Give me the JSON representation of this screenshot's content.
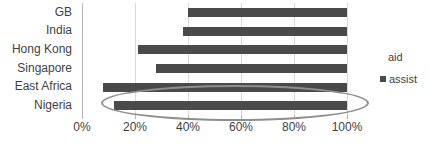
{
  "chart_data": {
    "type": "bar",
    "orientation": "horizontal",
    "title": "",
    "xlabel": "",
    "ylabel": "",
    "categories": [
      "GB",
      "India",
      "Hong Kong",
      "Singapore",
      "East Africa",
      "Nigeria"
    ],
    "series": [
      {
        "name": "assist",
        "starts": [
          40,
          38,
          21,
          28,
          8,
          12
        ],
        "ends": [
          100,
          100,
          100,
          100,
          100,
          100
        ],
        "values": [
          60,
          62,
          79,
          72,
          92,
          88
        ],
        "color": "#4a4a4a"
      }
    ],
    "xlim": [
      0,
      100
    ],
    "xticks": [
      0,
      20,
      40,
      60,
      80,
      100
    ],
    "xtick_labels": [
      "0%",
      "20%",
      "40%",
      "60%",
      "80%",
      "100%"
    ],
    "grid": true,
    "grid_axis": "x",
    "legend_position": "right",
    "annotations": [
      {
        "type": "ellipse",
        "label": "highlight-ellipse",
        "covers": [
          "East Africa",
          "Nigeria"
        ],
        "color": "#8e8e8e"
      }
    ]
  },
  "legend": {
    "title": "aid",
    "entries": [
      {
        "label": "assist",
        "color": "#4a4a4a",
        "marker": "square-swatch"
      }
    ]
  },
  "axes": {
    "category_labels": [
      "GB",
      "India",
      "Hong Kong",
      "Singapore",
      "East Africa",
      "Nigeria"
    ],
    "x_tick_labels": [
      "0%",
      "20%",
      "40%",
      "60%",
      "80%",
      "100%"
    ]
  },
  "colors": {
    "bar": "#4a4a4a",
    "gridline": "#d8d8d8",
    "axis": "#b5b5b5",
    "annotation": "#8e8e8e",
    "text": "#3f3f3f",
    "background": "#ffffff"
  }
}
